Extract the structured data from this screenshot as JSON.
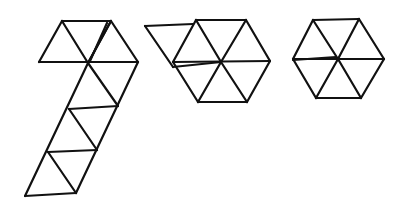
{
  "diagram": {
    "stroke_color": "#111111",
    "background": "#ffffff",
    "figures": [
      {
        "name": "triangle-strip",
        "label": "",
        "segments": [
          [
            62,
            21,
            111,
            21
          ],
          [
            39,
            62,
            138,
            62
          ],
          [
            39,
            62,
            62,
            21
          ],
          [
            62,
            21,
            88,
            63
          ],
          [
            88,
            63,
            111,
            21
          ],
          [
            111,
            21,
            138,
            62
          ],
          [
            111,
            21,
            88,
            63
          ],
          [
            107,
            23,
            90,
            61
          ],
          [
            88,
            63,
            25,
            196
          ],
          [
            138,
            62,
            76,
            193
          ],
          [
            88,
            63,
            118,
            106
          ],
          [
            69,
            109,
            118,
            106
          ],
          [
            69,
            109,
            97,
            150
          ],
          [
            48,
            152,
            97,
            150
          ],
          [
            48,
            152,
            76,
            193
          ],
          [
            25,
            196,
            76,
            193
          ]
        ]
      },
      {
        "name": "partially-folded-hexagon",
        "label": "",
        "segments": [
          [
            145,
            26,
            193,
            24
          ],
          [
            145,
            26,
            173,
            67
          ],
          [
            196,
            20,
            246,
            20
          ],
          [
            196,
            20,
            173,
            62
          ],
          [
            246,
            20,
            270,
            61
          ],
          [
            173,
            62,
            270,
            61
          ],
          [
            196,
            20,
            221,
            62
          ],
          [
            246,
            20,
            221,
            62
          ],
          [
            173,
            67,
            221,
            62
          ],
          [
            173,
            62,
            198,
            102
          ],
          [
            270,
            61,
            247,
            102
          ],
          [
            198,
            102,
            247,
            102
          ],
          [
            221,
            62,
            198,
            102
          ],
          [
            221,
            62,
            247,
            102
          ]
        ]
      },
      {
        "name": "completed-hexagon",
        "label": "",
        "segments": [
          [
            313,
            20,
            359,
            19
          ],
          [
            313,
            20,
            293,
            59
          ],
          [
            359,
            19,
            384,
            59
          ],
          [
            293,
            59,
            384,
            59
          ],
          [
            293,
            60,
            336,
            57
          ],
          [
            313,
            20,
            338,
            59
          ],
          [
            359,
            19,
            338,
            59
          ],
          [
            293,
            59,
            316,
            98
          ],
          [
            384,
            59,
            361,
            98
          ],
          [
            316,
            98,
            361,
            98
          ],
          [
            338,
            59,
            316,
            98
          ],
          [
            338,
            59,
            361,
            98
          ]
        ]
      }
    ]
  }
}
